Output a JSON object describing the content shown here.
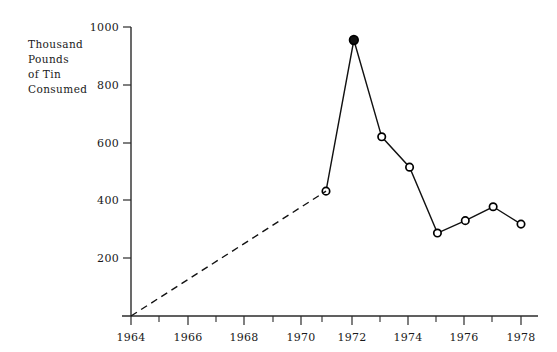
{
  "chart_data": {
    "type": "line",
    "title": "",
    "ylabel_lines": [
      "Thousand",
      "Pounds",
      "of Tin",
      "Consumed"
    ],
    "ylabel": "Thousand Pounds of Tin Consumed",
    "xlabel": "",
    "xlim": [
      1964,
      1978
    ],
    "ylim": [
      0,
      1000
    ],
    "grid": false,
    "legend": "none",
    "x_ticks_major": [
      1964,
      1966,
      1968,
      1970,
      1972,
      1974,
      1976,
      1978
    ],
    "x_tick_labels": [
      "1964",
      "1966",
      "1968",
      "1970",
      "1972",
      "1974",
      "1976",
      "1978"
    ],
    "x_ticks_minor": [
      1965,
      1967,
      1969,
      1971,
      1973,
      1975,
      1977
    ],
    "y_ticks": [
      200,
      400,
      600,
      800,
      1000
    ],
    "y_tick_labels": [
      "200",
      "400",
      "600",
      "800",
      "1000"
    ],
    "series": [
      {
        "name": "Tin Consumed",
        "style": "solid",
        "markers": true,
        "x": [
          1971,
          1972,
          1973,
          1974,
          1975,
          1976,
          1977,
          1978
        ],
        "values": [
          432,
          955,
          620,
          515,
          287,
          330,
          378,
          318
        ]
      },
      {
        "name": "Interpolated trend",
        "style": "dashed",
        "markers": false,
        "x": [
          1964,
          1971
        ],
        "values": [
          0,
          432
        ]
      }
    ],
    "annotations": []
  },
  "colors": {
    "line": "#111111",
    "axis": "#2b2b2b",
    "marker_fill": "#ffffff",
    "marker_peak_fill": "#111111",
    "background": "#ffffff",
    "text": "#1a1a1a"
  }
}
